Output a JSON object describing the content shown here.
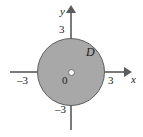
{
  "figure": {
    "background_color": "#ffffff",
    "region_fill_color": "#a8a8a8",
    "region_stroke_color": "#5e5e5e",
    "axis_color": "#7a7a7a"
  },
  "axes": {
    "x_label": "x",
    "y_label": "y",
    "origin_label": "0"
  },
  "ticks": {
    "y_positive": "3",
    "y_negative": "–3",
    "x_positive": "3",
    "x_negative": "–3"
  },
  "region": {
    "label": "D"
  },
  "chart_data": {
    "type": "scatter",
    "title": "",
    "xlabel": "x",
    "ylabel": "y",
    "xlim": [
      -3.8,
      3.8
    ],
    "ylim": [
      -3.8,
      3.8
    ],
    "grid": false,
    "legend": null,
    "annotations": [
      {
        "text": "D",
        "x": 1.4,
        "y": 1.6
      },
      {
        "text": "0",
        "x": -0.45,
        "y": -0.45
      }
    ],
    "xticks": [
      -3,
      3
    ],
    "xticklabels": [
      "–3",
      "3"
    ],
    "yticks": [
      -3,
      3
    ],
    "yticklabels": [
      "–3",
      "3"
    ],
    "shapes": [
      {
        "kind": "circle",
        "center": [
          0,
          0
        ],
        "radius": 3,
        "fill": "#a8a8a8",
        "stroke": "#5e5e5e",
        "label": "D"
      },
      {
        "kind": "point",
        "center": [
          0,
          0
        ],
        "radius": 0.15,
        "fill": "#ffffff",
        "stroke": "#6f6f6f",
        "label": "0"
      }
    ]
  }
}
